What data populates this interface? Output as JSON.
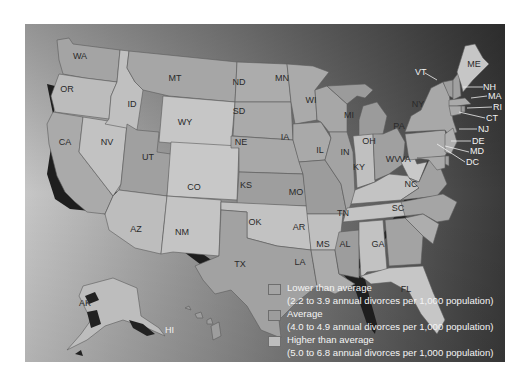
{
  "map": {
    "title": "Annual divorce rates by state",
    "colors": {
      "lower": "#a9a9a9",
      "average": "#9a9a9a",
      "higher": "#c4c4c4",
      "ocean_light": "#b8b8b8",
      "ocean_dark": "#3e3e3e",
      "shadow": "#1c1c1c"
    },
    "states": [
      {
        "abbr": "WA",
        "category": "average"
      },
      {
        "abbr": "OR",
        "category": "higher"
      },
      {
        "abbr": "CA",
        "category": "lower"
      },
      {
        "abbr": "NV",
        "category": "higher"
      },
      {
        "abbr": "ID",
        "category": "higher"
      },
      {
        "abbr": "MT",
        "category": "average"
      },
      {
        "abbr": "WY",
        "category": "higher"
      },
      {
        "abbr": "UT",
        "category": "average"
      },
      {
        "abbr": "AZ",
        "category": "higher"
      },
      {
        "abbr": "CO",
        "category": "higher"
      },
      {
        "abbr": "NM",
        "category": "higher"
      },
      {
        "abbr": "ND",
        "category": "lower"
      },
      {
        "abbr": "SD",
        "category": "lower"
      },
      {
        "abbr": "NE",
        "category": "lower"
      },
      {
        "abbr": "KS",
        "category": "average"
      },
      {
        "abbr": "OK",
        "category": "higher"
      },
      {
        "abbr": "TX",
        "category": "average"
      },
      {
        "abbr": "MN",
        "category": "lower"
      },
      {
        "abbr": "IA",
        "category": "lower"
      },
      {
        "abbr": "MO",
        "category": "average"
      },
      {
        "abbr": "AR",
        "category": "higher"
      },
      {
        "abbr": "LA",
        "category": "lower"
      },
      {
        "abbr": "WI",
        "category": "lower"
      },
      {
        "abbr": "IL",
        "category": "lower"
      },
      {
        "abbr": "MS",
        "category": "average"
      },
      {
        "abbr": "MI",
        "category": "average"
      },
      {
        "abbr": "IN",
        "category": "higher"
      },
      {
        "abbr": "KY",
        "category": "higher"
      },
      {
        "abbr": "TN",
        "category": "higher"
      },
      {
        "abbr": "AL",
        "category": "higher"
      },
      {
        "abbr": "OH",
        "category": "average"
      },
      {
        "abbr": "GA",
        "category": "average"
      },
      {
        "abbr": "FL",
        "category": "higher"
      },
      {
        "abbr": "WV",
        "category": "higher"
      },
      {
        "abbr": "VA",
        "category": "average"
      },
      {
        "abbr": "NC",
        "category": "average"
      },
      {
        "abbr": "SC",
        "category": "lower"
      },
      {
        "abbr": "PA",
        "category": "lower"
      },
      {
        "abbr": "NY",
        "category": "lower"
      },
      {
        "abbr": "VT",
        "category": "average"
      },
      {
        "abbr": "NH",
        "category": "average"
      },
      {
        "abbr": "ME",
        "category": "higher"
      },
      {
        "abbr": "MA",
        "category": "lower"
      },
      {
        "abbr": "RI",
        "category": "average"
      },
      {
        "abbr": "CT",
        "category": "lower"
      },
      {
        "abbr": "NJ",
        "category": "lower"
      },
      {
        "abbr": "DE",
        "category": "average"
      },
      {
        "abbr": "MD",
        "category": "lower"
      },
      {
        "abbr": "DC",
        "category": "lower"
      },
      {
        "abbr": "AK",
        "category": "higher"
      },
      {
        "abbr": "HI",
        "category": "average"
      }
    ]
  },
  "legend": {
    "items": [
      {
        "label": "Lower than average",
        "range": "(2.2 to 3.9 annual divorces per 1,000 population)",
        "color": "#a5a5a5"
      },
      {
        "label": "Average",
        "range": "(4.0 to 4.9 annual divorces per 1,000 population)",
        "color": "#9c9c9c"
      },
      {
        "label": "Higher than average",
        "range": "(5.0 to 6.8 annual divorces per 1,000 population)",
        "color": "#bdbdbd"
      }
    ]
  },
  "labels": {
    "WA": "WA",
    "OR": "OR",
    "CA": "CA",
    "NV": "NV",
    "ID": "ID",
    "MT": "MT",
    "WY": "WY",
    "UT": "UT",
    "AZ": "AZ",
    "CO": "CO",
    "NM": "NM",
    "ND": "ND",
    "SD": "SD",
    "NE": "NE",
    "KS": "KS",
    "OK": "OK",
    "TX": "TX",
    "MN": "MN",
    "IA": "IA",
    "MO": "MO",
    "AR": "AR",
    "LA": "LA",
    "WI": "WI",
    "IL": "IL",
    "MS": "MS",
    "MI": "MI",
    "IN": "IN",
    "KY": "KY",
    "TN": "TN",
    "AL": "AL",
    "OH": "OH",
    "GA": "GA",
    "FL": "FL",
    "WV": "WV",
    "VA": "VA",
    "NC": "NC",
    "SC": "SC",
    "PA": "PA",
    "NY": "NY",
    "VT": "VT",
    "NH": "NH",
    "ME": "ME",
    "MA": "MA",
    "RI": "RI",
    "CT": "CT",
    "NJ": "NJ",
    "DE": "DE",
    "MD": "MD",
    "DC": "DC",
    "AK": "AK",
    "HI": "HI"
  }
}
